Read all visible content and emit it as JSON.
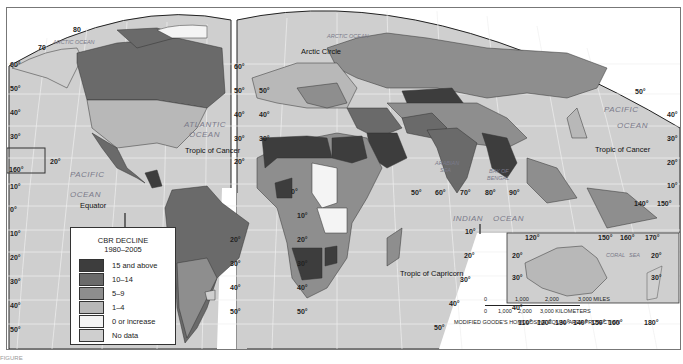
{
  "legend": {
    "title": "CBR DECLINE",
    "subtitle": "1980–2005",
    "items": [
      {
        "label": "15 and above",
        "color": "#3d3d3d"
      },
      {
        "label": "10–14",
        "color": "#6a6a6a"
      },
      {
        "label": "5–9",
        "color": "#8e8e8e"
      },
      {
        "label": "1–4",
        "color": "#b8b8b8"
      },
      {
        "label": "0 or increase",
        "color": "#f4f4f4"
      },
      {
        "label": "No data",
        "color": "#cfcfcf"
      }
    ]
  },
  "oceans": {
    "arctic_left": "ARCTIC OCEAN",
    "arctic_right": "ARCTIC OCEAN",
    "atlantic_1": "ATLANTIC",
    "atlantic_2": "OCEAN",
    "pacific_left_1": "PACIFIC",
    "pacific_left_2": "OCEAN",
    "pacific_right_1": "PACIFIC",
    "pacific_right_2": "OCEAN",
    "indian_1": "INDIAN",
    "indian_2": "OCEAN",
    "arabian_1": "ARABIAN",
    "arabian_2": "SEA",
    "bengal_1": "BAY OF",
    "bengal_2": "BENGAL",
    "coral_1": "CORAL",
    "coral_2": "SEA"
  },
  "reference_lines": {
    "arctic_circle": "Arctic Circle",
    "tropic_cancer_left": "Tropic of Cancer",
    "tropic_cancer_right": "Tropic of Cancer",
    "equator": "Equator",
    "tropic_capricorn": "Tropic of Capricorn"
  },
  "graticule": {
    "left_lat": [
      "60°",
      "50°",
      "40°",
      "30°",
      "20°",
      "10°",
      "0°",
      "10°",
      "20°",
      "30°",
      "40°",
      "50°"
    ],
    "top_left": [
      "80",
      "70"
    ],
    "left_inset_lon": "160°",
    "left_inset_lat": "20°",
    "mid_left_lat": [
      "60°",
      "50°",
      "40°",
      "30°",
      "20°",
      "10°"
    ],
    "mid_lat_1": [
      "50°",
      "40°",
      "30°"
    ],
    "sa_lat": [
      "10°",
      "20°",
      "30°",
      "40°",
      "50°"
    ],
    "sa_lat2": [
      "10°",
      "20°",
      "30°",
      "40°",
      "50°"
    ],
    "africa_lat": [
      "0°",
      "10°",
      "20°",
      "30°",
      "40°",
      "50°"
    ],
    "africa_lon": [
      "50°",
      "60°",
      "70°",
      "80°",
      "90°"
    ],
    "indian_lat": [
      "10°",
      "20°",
      "30°",
      "40°",
      "50°"
    ],
    "right_lat": [
      "50°",
      "40°",
      "30°",
      "20°",
      "10°"
    ],
    "se_lon": [
      "140°",
      "150°"
    ],
    "aus_top": [
      "120°",
      "150°",
      "160°",
      "170°"
    ],
    "aus_lat_left": [
      "20°",
      "30°",
      "40°"
    ],
    "aus_lat_right": [
      "20°",
      "30°"
    ],
    "aus_bottom": [
      "110°",
      "120°",
      "130°",
      "140°",
      "150°",
      "160°",
      "180°"
    ]
  },
  "scale": {
    "miles_ticks": [
      "0",
      "1,000",
      "2,000",
      "3,000 MILES"
    ],
    "km_ticks": [
      "0",
      "1,000",
      "2,000",
      "3,000 KILOMETERS"
    ],
    "projection": "MODIFIED GOODE'S HOMOLOSINE EQUAL-AREA PROJECTION"
  },
  "caption": "FIGURE"
}
